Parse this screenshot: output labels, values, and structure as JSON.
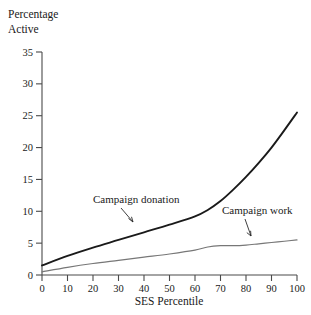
{
  "chart_data": {
    "type": "line",
    "title": "Percentage Active",
    "title_line1": "Percentage",
    "title_line2": "Active",
    "xlabel": "SES Percentile",
    "ylabel": "Percentage Active",
    "xlim": [
      0,
      100
    ],
    "ylim": [
      0,
      35
    ],
    "grid": false,
    "legend_position": "inline-annotations",
    "xticks": [
      "0",
      "10",
      "20",
      "30",
      "40",
      "50",
      "60",
      "70",
      "80",
      "90",
      "100"
    ],
    "yticks": [
      "0",
      "5",
      "10",
      "15",
      "20",
      "25",
      "30",
      "35"
    ],
    "x": [
      0,
      10,
      20,
      30,
      40,
      50,
      60,
      65,
      70,
      75,
      80,
      85,
      90,
      95,
      100
    ],
    "series": [
      {
        "name": "Campaign donation",
        "color": "#1a1a1a",
        "width": 1.9,
        "values": [
          1.5,
          3.0,
          4.3,
          5.5,
          6.7,
          7.9,
          9.2,
          10.2,
          11.6,
          13.4,
          15.4,
          17.6,
          20.0,
          22.7,
          25.5
        ]
      },
      {
        "name": "Campaign work",
        "color": "#777777",
        "width": 1.2,
        "values": [
          0.5,
          1.2,
          1.8,
          2.3,
          2.8,
          3.3,
          3.9,
          4.4,
          4.6,
          4.6,
          4.7,
          4.9,
          5.1,
          5.3,
          5.5
        ]
      }
    ],
    "annotations": [
      {
        "text": "Campaign donation",
        "x_px": 93,
        "y_px": 203
      },
      {
        "text": "Campaign work",
        "x_px": 222,
        "y_px": 214
      }
    ]
  }
}
